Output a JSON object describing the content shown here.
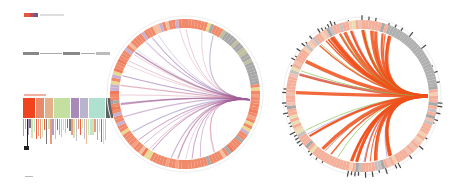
{
  "header": {
    "legend_swatch_colors": [
      "#e8553a",
      "#c04a5a",
      "#6a5a8a"
    ],
    "title_label": "—"
  },
  "flow": {
    "nodes": [
      "—",
      "—",
      "—"
    ]
  },
  "legend_panel": {
    "heading": "—",
    "categories": [
      {
        "color": "#f0431e",
        "width": 12
      },
      {
        "color": "#e88a6a",
        "width": 8
      },
      {
        "color": "#e4b08a",
        "width": 8
      },
      {
        "color": "#c4e0a0",
        "width": 16
      },
      {
        "color": "#a88ab8",
        "width": 8
      },
      {
        "color": "#b8b4cc",
        "width": 8
      },
      {
        "color": "#b0e0d0",
        "width": 16
      },
      {
        "color": "#606060",
        "width": 7
      }
    ],
    "footer": "—"
  },
  "chart_data": [
    {
      "type": "chord",
      "title": "",
      "center": [
        185,
        94
      ],
      "radius": 75,
      "ring_color": "#f08a6a",
      "link_colors": [
        "#9a5aa0",
        "#c05a7a",
        "#7a6ab0"
      ],
      "focus_angle_deg": 5,
      "link_count": 40
    },
    {
      "type": "chord",
      "title": "",
      "center": [
        362,
        96
      ],
      "radius": 76,
      "ring_color": "#f4b09a",
      "link_colors": [
        "#f0501a",
        "#88c050",
        "#b090d0"
      ],
      "focus_angle_deg": 0,
      "link_count": 55
    }
  ]
}
